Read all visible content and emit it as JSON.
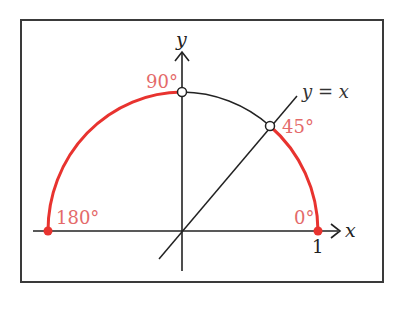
{
  "diagram": {
    "type": "unit-circle-upper-half",
    "axes": {
      "x_label": "x",
      "y_label": "y",
      "x_tick_label": "1"
    },
    "line": {
      "label": "y = x"
    },
    "points": [
      {
        "id": "p0",
        "label": "0°",
        "style": "filled",
        "color": "#e8332f"
      },
      {
        "id": "p45",
        "label": "45°",
        "style": "open",
        "color": "#222222"
      },
      {
        "id": "p90",
        "label": "90°",
        "style": "open",
        "color": "#222222"
      },
      {
        "id": "p180",
        "label": "180°",
        "style": "filled",
        "color": "#e8332f"
      }
    ],
    "arcs": [
      {
        "from": "0°",
        "to": "45°",
        "color": "#e8332f",
        "highlighted": true
      },
      {
        "from": "45°",
        "to": "90°",
        "color": "#222222",
        "highlighted": false
      },
      {
        "from": "90°",
        "to": "180°",
        "color": "#e8332f",
        "highlighted": true
      }
    ],
    "colors": {
      "highlight": "#e8332f",
      "label_red": "#e46a6a",
      "ink": "#222222",
      "frame": "#3a3a3a"
    }
  }
}
